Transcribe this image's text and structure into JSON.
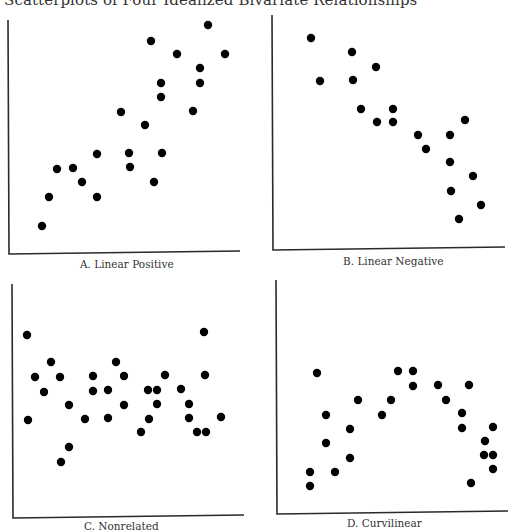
{
  "title": "Scatterplots of Four Idealized Bivariate Relationships",
  "chart_data": [
    {
      "type": "scatter",
      "title": "A. Linear Positive",
      "xlabel": "",
      "ylabel": "",
      "grid": false,
      "axes_px": {
        "x0": 8,
        "y0": 254,
        "x1": 240,
        "y1": 20
      },
      "points_px": [
        [
          208,
          25
        ],
        [
          151,
          41
        ],
        [
          177,
          54
        ],
        [
          225,
          54
        ],
        [
          200,
          68
        ],
        [
          161,
          83
        ],
        [
          200,
          83
        ],
        [
          161,
          97
        ],
        [
          121,
          112
        ],
        [
          193,
          111
        ],
        [
          145,
          125
        ],
        [
          97,
          154
        ],
        [
          129,
          153
        ],
        [
          162,
          153
        ],
        [
          57,
          169
        ],
        [
          73,
          168
        ],
        [
          130,
          167
        ],
        [
          82,
          182
        ],
        [
          154,
          182
        ],
        [
          49,
          197
        ],
        [
          97,
          197
        ],
        [
          42,
          226
        ]
      ]
    },
    {
      "type": "scatter",
      "title": "B. Linear Negative",
      "xlabel": "",
      "ylabel": "",
      "grid": false,
      "axes_px": {
        "x0": 272,
        "y0": 250,
        "x1": 505,
        "y1": 15
      },
      "points_px": [
        [
          311,
          38
        ],
        [
          352,
          52
        ],
        [
          376,
          67
        ],
        [
          320,
          81
        ],
        [
          353,
          80
        ],
        [
          361,
          109
        ],
        [
          393,
          109
        ],
        [
          377,
          122
        ],
        [
          393,
          122
        ],
        [
          465,
          120
        ],
        [
          418,
          135
        ],
        [
          450,
          135
        ],
        [
          426,
          149
        ],
        [
          450,
          162
        ],
        [
          473,
          176
        ],
        [
          451,
          191
        ],
        [
          481,
          205
        ],
        [
          459,
          219
        ]
      ]
    },
    {
      "type": "scatter",
      "title": "C. Nonrelated",
      "xlabel": "",
      "ylabel": "",
      "grid": false,
      "axes_px": {
        "x0": 12,
        "y0": 518,
        "x1": 244,
        "y1": 284
      },
      "points_px": [
        [
          27,
          335
        ],
        [
          204,
          332
        ],
        [
          51,
          362
        ],
        [
          116,
          362
        ],
        [
          35,
          377
        ],
        [
          60,
          377
        ],
        [
          93,
          376
        ],
        [
          124,
          376
        ],
        [
          165,
          375
        ],
        [
          205,
          375
        ],
        [
          44,
          392
        ],
        [
          93,
          391
        ],
        [
          108,
          390
        ],
        [
          148,
          390
        ],
        [
          157,
          390
        ],
        [
          181,
          389
        ],
        [
          69,
          405
        ],
        [
          124,
          405
        ],
        [
          157,
          404
        ],
        [
          189,
          404
        ],
        [
          28,
          420
        ],
        [
          85,
          419
        ],
        [
          108,
          418
        ],
        [
          149,
          419
        ],
        [
          189,
          418
        ],
        [
          221,
          417
        ],
        [
          141,
          432
        ],
        [
          197,
          432
        ],
        [
          206,
          432
        ],
        [
          69,
          447
        ],
        [
          61,
          462
        ]
      ]
    },
    {
      "type": "scatter",
      "title": "D. Curvilinear",
      "xlabel": "",
      "ylabel": "",
      "grid": false,
      "axes_px": {
        "x0": 276,
        "y0": 514,
        "x1": 508,
        "y1": 280
      },
      "points_px": [
        [
          317,
          373
        ],
        [
          398,
          371
        ],
        [
          413,
          371
        ],
        [
          413,
          386
        ],
        [
          438,
          385
        ],
        [
          469,
          385
        ],
        [
          358,
          400
        ],
        [
          391,
          400
        ],
        [
          446,
          400
        ],
        [
          326,
          415
        ],
        [
          382,
          415
        ],
        [
          462,
          413
        ],
        [
          350,
          429
        ],
        [
          462,
          428
        ],
        [
          493,
          427
        ],
        [
          326,
          443
        ],
        [
          485,
          441
        ],
        [
          350,
          458
        ],
        [
          484,
          455
        ],
        [
          493,
          455
        ],
        [
          310,
          472
        ],
        [
          335,
          472
        ],
        [
          493,
          469
        ],
        [
          310,
          486
        ],
        [
          471,
          483
        ]
      ]
    }
  ],
  "captions": {
    "a": "A. Linear Positive",
    "b": "B. Linear Negative",
    "c": "C. Nonrelated",
    "d": "D. Curvilinear"
  },
  "style": {
    "dot_color": "#000000",
    "axis_color": "#2a2a2a",
    "dot_radius": 4.2
  }
}
